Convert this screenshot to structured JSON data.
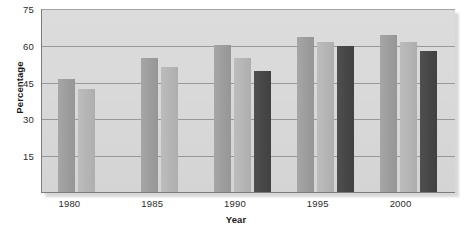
{
  "chart_data": {
    "type": "bar",
    "title": "",
    "xlabel": "Year",
    "ylabel": "Percentage",
    "categories": [
      "1980",
      "1985",
      "1990",
      "1995",
      "2000"
    ],
    "series": [
      {
        "name": "series-1",
        "color": "#9c9c9c",
        "values": [
          46,
          54.5,
          60,
          63,
          64
        ]
      },
      {
        "name": "series-2",
        "color": "#b4b4b4",
        "values": [
          42,
          51,
          54.5,
          61,
          61
        ]
      },
      {
        "name": "series-3",
        "color": "#464646",
        "values": [
          null,
          null,
          49.5,
          59.5,
          57.5
        ]
      }
    ],
    "ylim": [
      0,
      75
    ],
    "yticks": [
      15,
      30,
      45,
      60,
      75
    ],
    "ytick_labels": [
      "15",
      "30",
      "45",
      "60",
      "75"
    ],
    "xtick_labels": [
      "1980",
      "1985",
      "1990",
      "1995",
      "2000"
    ],
    "grid": true,
    "grid_axis": "y",
    "legend": "none",
    "plot_background": "#d9d9d9",
    "axis_color": "#7d7d7d"
  }
}
